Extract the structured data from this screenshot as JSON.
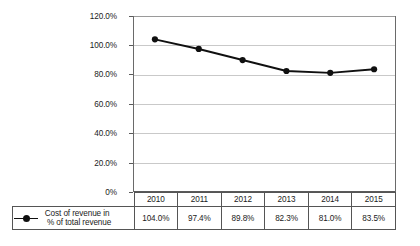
{
  "chart_data": {
    "type": "line",
    "title": "",
    "xlabel": "",
    "ylabel": "",
    "categories": [
      "2010",
      "2011",
      "2012",
      "2013",
      "2014",
      "2015"
    ],
    "series": [
      {
        "name": "Cost of revenue in % of total revenue",
        "values": [
          104.0,
          97.4,
          89.8,
          82.3,
          81.0,
          83.5
        ],
        "labels": [
          "104.0%",
          "97.4%",
          "89.8%",
          "82.3%",
          "81.0%",
          "83.5%"
        ],
        "color": "#101010",
        "marker": "filled-circle"
      }
    ],
    "ylim": [
      0,
      120
    ],
    "ytick_values": [
      120,
      100,
      80,
      60,
      40,
      20,
      0
    ],
    "ytick_labels": [
      "120.0%",
      "100.0%",
      "80.0%",
      "60.0%",
      "40.0%",
      "20.0%",
      "0%"
    ],
    "grid": "horizontal",
    "legend_position": "bottom-table",
    "colors": {
      "series": "#101010",
      "gridline": "#c9c9c9",
      "axis": "#5a5a5a",
      "table_border": "#555555",
      "background": "#ffffff"
    }
  },
  "legend": {
    "line1": "Cost of revenue in",
    "line2": "% of total revenue",
    "symbol": "line-with-circle-marker"
  },
  "table": {
    "header_row": [
      "2010",
      "2011",
      "2012",
      "2013",
      "2014",
      "2015"
    ],
    "value_row": [
      "104.0%",
      "97.4%",
      "89.8%",
      "82.3%",
      "81.0%",
      "83.5%"
    ]
  }
}
